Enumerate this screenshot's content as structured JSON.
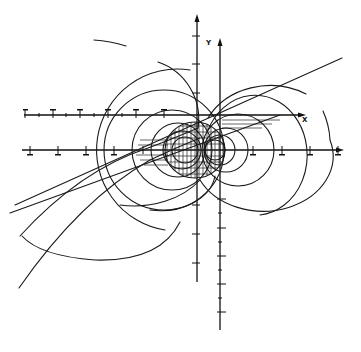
{
  "diagram": {
    "type": "field-line diagram with two coordinate frames",
    "axes": {
      "primary": {
        "x_label": "",
        "y_label": ""
      },
      "secondary": {
        "x_label": "X",
        "y_label": "Y"
      }
    },
    "tick_labels_legible": false,
    "central_body": "hatched ellipse (grid-filled) at origin region",
    "elements": [
      "nested circular field lines left of center",
      "nested circular field lines right of center",
      "two diagonal straight lines crossing center",
      "two curved trajectories descending to lower-left",
      "short arc fragment upper-left"
    ],
    "colors": {
      "ink": "#1a1a1a",
      "background": "#ffffff"
    }
  }
}
